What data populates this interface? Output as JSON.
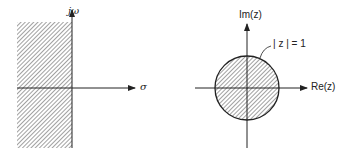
{
  "left_plane": {
    "vertical_axis_label": "jω",
    "horizontal_axis_label": "σ",
    "shaded_region": "left half-plane"
  },
  "right_plane": {
    "vertical_axis_label": "Im(z)",
    "horizontal_axis_label": "Re(z)",
    "circle_label": "| z | = 1",
    "shaded_region": "unit disk"
  },
  "colors": {
    "stroke": "#222222",
    "hatch": "#444444",
    "background": "#ffffff"
  }
}
